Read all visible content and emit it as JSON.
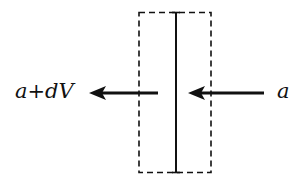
{
  "diagram": {
    "labels": {
      "outflow": "a+dV",
      "inflow": "a"
    },
    "colors": {
      "ink": "#111111",
      "background": "#ffffff"
    },
    "elements": {
      "control_volume": "dashed rectangle",
      "plate": "solid vertical line",
      "outflow_arrow": "leftward arrow exiting volume",
      "inflow_arrow": "leftward arrow entering volume"
    }
  }
}
